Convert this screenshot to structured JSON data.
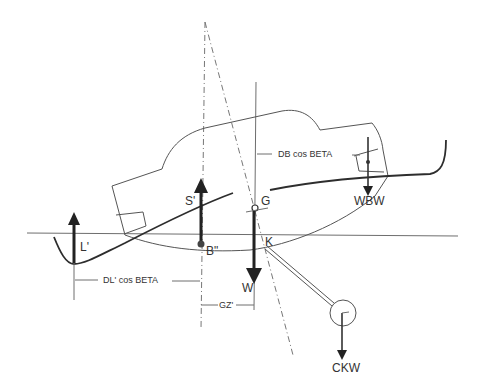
{
  "diagram": {
    "labels": {
      "side_force": "S'",
      "center_of_lateral_resistance": "B\"",
      "leeward_lift": "L'",
      "center_of_gravity": "G",
      "weight": "W",
      "keel_point": "K",
      "water_ballast_weight": "WBW",
      "canting_keel_weight": "CKW",
      "dim_db": "DB cos BETA",
      "dim_dl": "DL' cos BETA",
      "dim_gz": "GZ'"
    },
    "colors": {
      "line": "#6e6e6e",
      "arrow": "#222222",
      "text": "#333333",
      "background": "#ffffff"
    }
  }
}
